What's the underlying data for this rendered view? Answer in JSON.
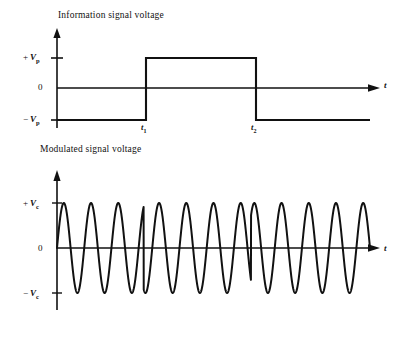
{
  "figure": {
    "background": "#ffffff",
    "stroke": "#111111",
    "plots": [
      {
        "id": "information-signal",
        "title": "Information signal voltage",
        "y_tick_labels": [
          "+ V",
          "0",
          "- V"
        ],
        "y_tick_subscripts": [
          "p",
          "",
          "p"
        ],
        "x_axis_label": "t",
        "x_marker_labels": [
          "t",
          "t"
        ],
        "x_marker_subscripts": [
          "1",
          "2"
        ]
      },
      {
        "id": "modulated-signal",
        "title": "Modulated signal voltage",
        "y_tick_labels": [
          "+ V",
          "0",
          "- V"
        ],
        "y_tick_subscripts": [
          "c",
          "",
          "c"
        ],
        "x_axis_label": "t"
      }
    ]
  },
  "chart_data": [
    {
      "type": "line",
      "id": "information-signal",
      "title": "Information signal voltage",
      "xlabel": "t",
      "ylabel": "",
      "ylim": [
        -1.3,
        1.3
      ],
      "xlim": [
        0,
        1
      ],
      "grid": false,
      "legend": null,
      "ytick_values": [
        1,
        0,
        -1
      ],
      "ytick_labels": [
        "+ Vp",
        "0",
        "- Vp"
      ],
      "xtick_values": [
        0.277,
        0.62
      ],
      "xtick_labels": [
        "t1",
        "t2"
      ],
      "annotations": [
        "binary NRZ data waveform: -Vp, then +Vp between t1 and t2, then -Vp"
      ],
      "x": [
        0.0,
        0.277,
        0.277,
        0.62,
        0.62,
        1.0
      ],
      "y": [
        -1,
        -1,
        1,
        1,
        -1,
        -1
      ]
    },
    {
      "type": "line",
      "id": "modulated-signal",
      "title": "Modulated signal voltage",
      "xlabel": "t",
      "ylabel": "",
      "ylim": [
        -1.25,
        1.25
      ],
      "xlim": [
        0,
        1
      ],
      "grid": false,
      "legend": null,
      "ytick_values": [
        1,
        0,
        -1
      ],
      "ytick_labels": [
        "+ Vc",
        "0",
        "- Vc"
      ],
      "annotations": [
        "phase-shift-keyed carrier: 180 degree phase reversal at t1 and again at t2"
      ],
      "carrier_cycles": 11.5,
      "phase_reversal_positions": [
        0.277,
        0.62
      ],
      "amplitude": 1.0
    }
  ]
}
